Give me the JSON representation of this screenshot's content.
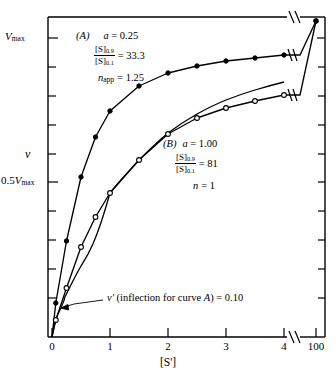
{
  "figure": {
    "type": "line-chart",
    "background": "#ffffff",
    "ink": "#000000"
  },
  "axes": {
    "x": {
      "title": "[S']",
      "tick_labels": [
        "0",
        "1",
        "2",
        "3",
        "4",
        "100"
      ],
      "break_after": "4",
      "break_symbol": "//"
    },
    "y": {
      "title": "v",
      "tick_labels": {
        "top": "Vmax",
        "half": "0.5Vmax"
      },
      "top_label_main": "V",
      "top_label_sub": "max",
      "half_label_main": "0.5V",
      "half_label_sub": "max",
      "n_ticks": 10
    }
  },
  "annotations": {
    "curve_a": {
      "caption": "(A)",
      "a_symbol": "a",
      "a_value": "= 0.25",
      "ratio_num": "[S]",
      "ratio_num_sub": "0.9",
      "ratio_den": "[S]",
      "ratio_den_sub": "0.1",
      "ratio_value": "= 33.3",
      "n_symbol": "n",
      "n_sub": "app",
      "n_value": "= 1.25"
    },
    "curve_b": {
      "caption": "(B)",
      "a_symbol": "a",
      "a_value": "= 1.00",
      "ratio_num": "[S]",
      "ratio_num_sub": "0.9",
      "ratio_den": "[S]",
      "ratio_den_sub": "0.1",
      "ratio_value": "= 81",
      "n_symbol": "n",
      "n_value": "= 1"
    },
    "inflection": {
      "symbol": "v′",
      "text": " (inflection for curve ",
      "curve": "A",
      "text_end": ") = 0.10"
    }
  },
  "chart_data": {
    "type": "line",
    "title": "",
    "xlabel": "[S']",
    "ylabel": "v",
    "xlim": [
      0,
      4.6
    ],
    "ylim": [
      0,
      1.0
    ],
    "x_axis_break": {
      "from": 4.3,
      "to": 100
    },
    "grid": false,
    "legend": "inline-annotations",
    "y_tick_values": [
      0.5,
      1.0
    ],
    "y_tick_labels": [
      "0.5Vmax",
      "Vmax"
    ],
    "x_tick_values": [
      0,
      1,
      2,
      3,
      4,
      100
    ],
    "x_tick_labels": [
      "0",
      "1",
      "2",
      "3",
      "4",
      "100"
    ],
    "series": [
      {
        "name": "(A)",
        "marker": "filled-circle",
        "a": 0.25,
        "ratio_s09_s01": 33.3,
        "n_app": 1.25,
        "x": [
          0,
          0.1,
          0.25,
          0.5,
          0.75,
          1.0,
          1.5,
          2.0,
          2.5,
          3.0,
          3.5,
          4.0,
          100
        ],
        "values": [
          0,
          0.105,
          0.3,
          0.5,
          0.625,
          0.705,
          0.785,
          0.825,
          0.845,
          0.862,
          0.872,
          0.882,
          1.0
        ]
      },
      {
        "name": "(B)",
        "marker": "open-circle",
        "a": 1.0,
        "ratio_s09_s01": 81,
        "n": 1,
        "x": [
          0,
          0.1,
          0.25,
          0.5,
          0.75,
          1.0,
          1.5,
          2.0,
          2.5,
          3.0,
          3.5,
          4.0,
          100
        ],
        "values": [
          0,
          0.055,
          0.155,
          0.28,
          0.375,
          0.45,
          0.56,
          0.635,
          0.685,
          0.715,
          0.74,
          0.76,
          1.0
        ]
      }
    ],
    "annotations": [
      {
        "text": "v′ (inflection for curve A) = 0.10",
        "points_to": [
          0.1,
          0.105
        ]
      }
    ]
  }
}
